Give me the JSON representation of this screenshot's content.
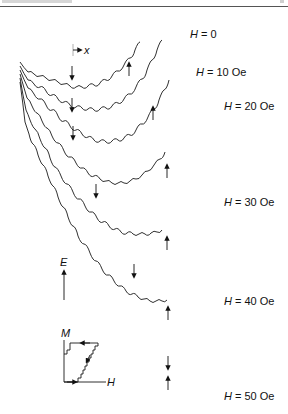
{
  "figure": {
    "curves": [
      {
        "field": "H = 0",
        "label_var": "H",
        "label_rest": " = 0"
      },
      {
        "field": "H = 10 Oe",
        "label_var": "H",
        "label_rest": " = 10 Oe"
      },
      {
        "field": "H = 20 Oe",
        "label_var": "H",
        "label_rest": " = 20 Oe"
      },
      {
        "field": "H = 30 Oe",
        "label_var": "H",
        "label_rest": " = 30 Oe"
      },
      {
        "field": "H = 40 Oe",
        "label_var": "H",
        "label_rest": " = 40 Oe"
      },
      {
        "field": "H = 50 Oe",
        "label_var": "H",
        "label_rest": " = 50 Oe"
      }
    ],
    "x_axis_label": "x",
    "energy_axis_label": "E",
    "inset": {
      "y_label": "M",
      "x_label": "H",
      "description": "staircase hysteresis loop"
    },
    "markers": {
      "down_arrow": "wall position (down arrow)",
      "up_arrow": "wall position (up arrow)"
    }
  }
}
